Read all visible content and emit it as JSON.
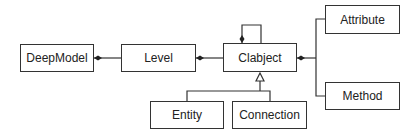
{
  "diagram": {
    "type": "uml-class-diagram",
    "classes": [
      {
        "id": "deepmodel",
        "label": "DeepModel"
      },
      {
        "id": "level",
        "label": "Level"
      },
      {
        "id": "clabject",
        "label": "Clabject"
      },
      {
        "id": "attribute",
        "label": "Attribute"
      },
      {
        "id": "method",
        "label": "Method"
      },
      {
        "id": "entity",
        "label": "Entity"
      },
      {
        "id": "connection",
        "label": "Connection"
      }
    ],
    "relations": [
      {
        "from": "level",
        "to": "deepmodel",
        "kind": "composition"
      },
      {
        "from": "clabject",
        "to": "level",
        "kind": "composition"
      },
      {
        "from": "clabject",
        "to": "clabject",
        "kind": "composition-self"
      },
      {
        "from": "attribute",
        "to": "clabject",
        "kind": "composition"
      },
      {
        "from": "method",
        "to": "clabject",
        "kind": "composition"
      },
      {
        "from": "entity",
        "to": "clabject",
        "kind": "generalization"
      },
      {
        "from": "connection",
        "to": "clabject",
        "kind": "generalization"
      }
    ]
  }
}
